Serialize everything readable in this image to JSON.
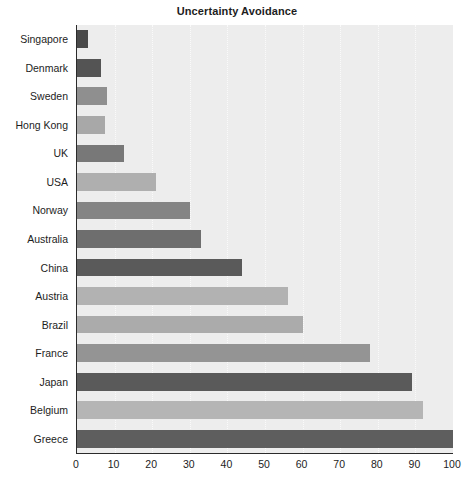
{
  "chart_data": {
    "type": "bar",
    "orientation": "horizontal",
    "title": "Uncertainty Avoidance",
    "xlabel": "",
    "ylabel": "",
    "xlim": [
      0,
      100
    ],
    "xticks": [
      "0",
      "10",
      "20",
      "30",
      "40",
      "50",
      "60",
      "70",
      "80",
      "90",
      "100"
    ],
    "grid": true,
    "grid_axis": "x",
    "legend": "none",
    "categories": [
      "Singapore",
      "Denmark",
      "Sweden",
      "Hong Kong",
      "UK",
      "USA",
      "Norway",
      "Australia",
      "China",
      "Austria",
      "Brazil",
      "France",
      "Japan",
      "Belgium",
      "Greece"
    ],
    "values": [
      3,
      6.5,
      8,
      7.5,
      12.5,
      21,
      30,
      33,
      44,
      56,
      60,
      78,
      89,
      92,
      100
    ],
    "bar_colors": [
      "#4a4a4a",
      "#545454",
      "#8f8f8f",
      "#a8a8a8",
      "#787878",
      "#afafaf",
      "#848484",
      "#6e6e6e",
      "#5a5a5a",
      "#b2b2b2",
      "#ababab",
      "#949494",
      "#5a5a5a",
      "#b5b5b5",
      "#5e5e5e"
    ]
  },
  "style": {
    "plot_background": "#ededed",
    "page_background": "#ffffff",
    "axis_color": "#2b2b2b",
    "grid_color": "#fdfdfd",
    "text_color": "#1d1d1d"
  }
}
